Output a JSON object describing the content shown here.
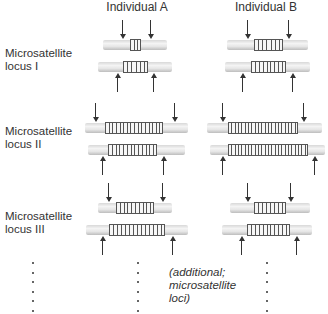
{
  "headers": {
    "individual_a": "Individual A",
    "individual_b": "Individual B"
  },
  "loci": [
    {
      "label_line1": "Microsatellite",
      "label_line2": "locus I",
      "label_y": 47,
      "alleles": [
        {
          "individual": "A",
          "y": 40,
          "tube": [
            103,
            167
          ],
          "repeat": [
            130,
            141
          ],
          "units": 3,
          "arrow": "down",
          "arrows_x": [
            122,
            150
          ]
        },
        {
          "individual": "A",
          "y": 62,
          "tube": [
            98,
            172
          ],
          "repeat": [
            123,
            148
          ],
          "units": 6,
          "arrow": "up",
          "arrows_x": [
            117,
            153
          ]
        },
        {
          "individual": "B",
          "y": 40,
          "tube": [
            227,
            308
          ],
          "repeat": [
            254,
            283
          ],
          "units": 7,
          "arrow": "down",
          "arrows_x": [
            247,
            288
          ]
        },
        {
          "individual": "B",
          "y": 62,
          "tube": [
            225,
            310
          ],
          "repeat": [
            251,
            286
          ],
          "units": 9,
          "arrow": "up",
          "arrows_x": [
            242,
            292
          ]
        }
      ]
    },
    {
      "label_line1": "Microsatellite",
      "label_line2": "locus II",
      "label_y": 125,
      "alleles": [
        {
          "individual": "A",
          "y": 123,
          "tube": [
            85,
            188
          ],
          "repeat": [
            105,
            163
          ],
          "units": 16,
          "arrow": "down",
          "arrows_x": [
            95,
            174
          ]
        },
        {
          "individual": "A",
          "y": 145,
          "tube": [
            88,
            185
          ],
          "repeat": [
            108,
            157
          ],
          "units": 13,
          "arrow": "up",
          "arrows_x": [
            102,
            163
          ]
        },
        {
          "individual": "B",
          "y": 123,
          "tube": [
            207,
            322
          ],
          "repeat": [
            228,
            298
          ],
          "units": 21,
          "arrow": "down",
          "arrows_x": [
            222,
            303
          ]
        },
        {
          "individual": "B",
          "y": 145,
          "tube": [
            210,
            325
          ],
          "repeat": [
            228,
            308
          ],
          "units": 24,
          "arrow": "up",
          "arrows_x": [
            222,
            314
          ]
        }
      ]
    },
    {
      "label_line1": "Microsatellite",
      "label_line2": "locus III",
      "label_y": 210,
      "alleles": [
        {
          "individual": "A",
          "y": 203,
          "tube": [
            98,
            172
          ],
          "repeat": [
            116,
            154
          ],
          "units": 10,
          "arrow": "down",
          "arrows_x": [
            108,
            162
          ]
        },
        {
          "individual": "A",
          "y": 225,
          "tube": [
            86,
            188
          ],
          "repeat": [
            109,
            165
          ],
          "units": 14,
          "arrow": "up",
          "arrows_x": [
            102,
            172
          ]
        },
        {
          "individual": "B",
          "y": 203,
          "tube": [
            230,
            310
          ],
          "repeat": [
            254,
            286
          ],
          "units": 8,
          "arrow": "down",
          "arrows_x": [
            247,
            290
          ]
        },
        {
          "individual": "B",
          "y": 225,
          "tube": [
            222,
            312
          ],
          "repeat": [
            247,
            290
          ],
          "units": 11,
          "arrow": "up",
          "arrows_x": [
            241,
            296
          ]
        }
      ]
    }
  ],
  "additional_note": {
    "line1": "(additional;",
    "line2": "microsatellite",
    "line3": "loci)"
  },
  "ellipsis_columns_x": [
    32,
    137,
    266
  ],
  "ellipsis_dot_count": 6
}
